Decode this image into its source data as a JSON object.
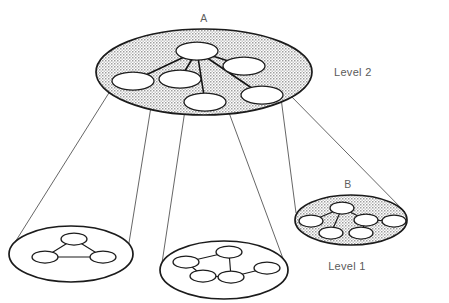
{
  "figure": {
    "background_color": "#ffffff",
    "ink_color": "#1b1b1b",
    "shaded_fill_color": "#d9d9d9",
    "label_color": "#5a5a5a"
  },
  "labels": {
    "cluster_a": "A",
    "cluster_b": "B",
    "level_two": "Level 2",
    "level_one": "Level 1"
  },
  "levels": [
    {
      "id": "level-2",
      "name": "Level 2",
      "label_position": "right",
      "shaded": true,
      "cluster_count": 1
    },
    {
      "id": "level-1",
      "name": "Level 1",
      "label_position": "right-bottom",
      "shaded": false,
      "cluster_count": 3
    }
  ],
  "clusters": [
    {
      "id": "cluster-a",
      "label": "A",
      "level": "Level 2",
      "shaded": true,
      "node_count": 6,
      "edge_count": 5,
      "topology": "star",
      "ellipse": {
        "cx": 204,
        "cy": 72,
        "rx": 108,
        "ry": 43
      },
      "nodes": [
        {
          "id": "a1",
          "cx": 197,
          "cy": 51,
          "rx": 21,
          "ry": 9,
          "role": "hub"
        },
        {
          "id": "a2",
          "cx": 133,
          "cy": 81,
          "rx": 21,
          "ry": 9,
          "role": "leaf"
        },
        {
          "id": "a3",
          "cx": 180,
          "cy": 79,
          "rx": 21,
          "ry": 9,
          "role": "leaf"
        },
        {
          "id": "a4",
          "cx": 244,
          "cy": 66,
          "rx": 21,
          "ry": 9,
          "role": "leaf"
        },
        {
          "id": "a5",
          "cx": 205,
          "cy": 102,
          "rx": 21,
          "ry": 9,
          "role": "leaf"
        },
        {
          "id": "a6",
          "cx": 262,
          "cy": 95,
          "rx": 21,
          "ry": 9,
          "role": "leaf"
        }
      ],
      "edges": [
        [
          "a1",
          "a2"
        ],
        [
          "a1",
          "a3"
        ],
        [
          "a1",
          "a4"
        ],
        [
          "a1",
          "a5"
        ],
        [
          "a1",
          "a6"
        ]
      ]
    },
    {
      "id": "cluster-left",
      "label": "",
      "level": "Level 1",
      "shaded": false,
      "node_count": 3,
      "edge_count": 3,
      "topology": "triangle",
      "ellipse": {
        "cx": 71,
        "cy": 254,
        "rx": 62,
        "ry": 28
      },
      "nodes": [
        {
          "id": "l1",
          "cx": 74,
          "cy": 239,
          "rx": 13,
          "ry": 6,
          "role": "apex"
        },
        {
          "id": "l2",
          "cx": 45,
          "cy": 257,
          "rx": 13,
          "ry": 6,
          "role": "base-left"
        },
        {
          "id": "l3",
          "cx": 103,
          "cy": 257,
          "rx": 13,
          "ry": 6,
          "role": "base-right"
        }
      ],
      "edges": [
        [
          "l1",
          "l2"
        ],
        [
          "l1",
          "l3"
        ],
        [
          "l2",
          "l3"
        ]
      ]
    },
    {
      "id": "cluster-middle",
      "label": "",
      "level": "Level 1",
      "shaded": false,
      "node_count": 5,
      "edge_count": 4,
      "topology": "tree-path",
      "ellipse": {
        "cx": 224,
        "cy": 270,
        "rx": 64,
        "ry": 29
      },
      "nodes": [
        {
          "id": "m1",
          "cx": 186,
          "cy": 262,
          "rx": 13,
          "ry": 6,
          "role": "leaf"
        },
        {
          "id": "m2",
          "cx": 203,
          "cy": 276,
          "rx": 13,
          "ry": 6,
          "role": "leaf"
        },
        {
          "id": "m3",
          "cx": 229,
          "cy": 252,
          "rx": 13,
          "ry": 6,
          "role": "leaf"
        },
        {
          "id": "m4",
          "cx": 231,
          "cy": 277,
          "rx": 13,
          "ry": 6,
          "role": "hub"
        },
        {
          "id": "m5",
          "cx": 267,
          "cy": 268,
          "rx": 13,
          "ry": 6,
          "role": "leaf"
        }
      ],
      "edges": [
        [
          "m1",
          "m2"
        ],
        [
          "m2",
          "m4"
        ],
        [
          "m3",
          "m4"
        ],
        [
          "m4",
          "m5"
        ]
      ]
    },
    {
      "id": "cluster-b",
      "label": "B",
      "level": "Level 1",
      "shaded": true,
      "node_count": 6,
      "edge_count": 5,
      "topology": "double-star",
      "ellipse": {
        "cx": 351,
        "cy": 220,
        "rx": 56,
        "ry": 25
      },
      "nodes": [
        {
          "id": "b1",
          "cx": 342,
          "cy": 208,
          "rx": 12,
          "ry": 6,
          "role": "hub"
        },
        {
          "id": "b2",
          "cx": 311,
          "cy": 221,
          "rx": 12,
          "ry": 6,
          "role": "leaf"
        },
        {
          "id": "b3",
          "cx": 331,
          "cy": 233,
          "rx": 12,
          "ry": 6,
          "role": "leaf"
        },
        {
          "id": "b4",
          "cx": 366,
          "cy": 220,
          "rx": 12,
          "ry": 6,
          "role": "hub"
        },
        {
          "id": "b5",
          "cx": 361,
          "cy": 233,
          "rx": 12,
          "ry": 6,
          "role": "leaf"
        },
        {
          "id": "b6",
          "cx": 394,
          "cy": 221,
          "rx": 12,
          "ry": 6,
          "role": "leaf"
        }
      ],
      "edges": [
        [
          "b1",
          "b2"
        ],
        [
          "b1",
          "b3"
        ],
        [
          "b1",
          "b4"
        ],
        [
          "b4",
          "b5"
        ],
        [
          "b4",
          "b6"
        ]
      ]
    }
  ],
  "projections": [
    {
      "id": "cone-left",
      "from_cluster": "cluster-a",
      "to_cluster": "cluster-left",
      "lines": [
        {
          "x1": 112,
          "y1": 88,
          "x2": 12,
          "y2": 247
        },
        {
          "x1": 154,
          "y1": 88,
          "x2": 128,
          "y2": 249
        }
      ]
    },
    {
      "id": "cone-middle",
      "from_cluster": "cluster-a",
      "to_cluster": "cluster-middle",
      "lines": [
        {
          "x1": 185,
          "y1": 110,
          "x2": 162,
          "y2": 263
        },
        {
          "x1": 228,
          "y1": 110,
          "x2": 285,
          "y2": 264
        }
      ]
    },
    {
      "id": "cone-right",
      "from_cluster": "cluster-a",
      "to_cluster": "cluster-b",
      "lines": [
        {
          "x1": 281,
          "y1": 98,
          "x2": 296,
          "y2": 213
        },
        {
          "x1": 288,
          "y1": 93,
          "x2": 405,
          "y2": 212
        }
      ]
    }
  ]
}
